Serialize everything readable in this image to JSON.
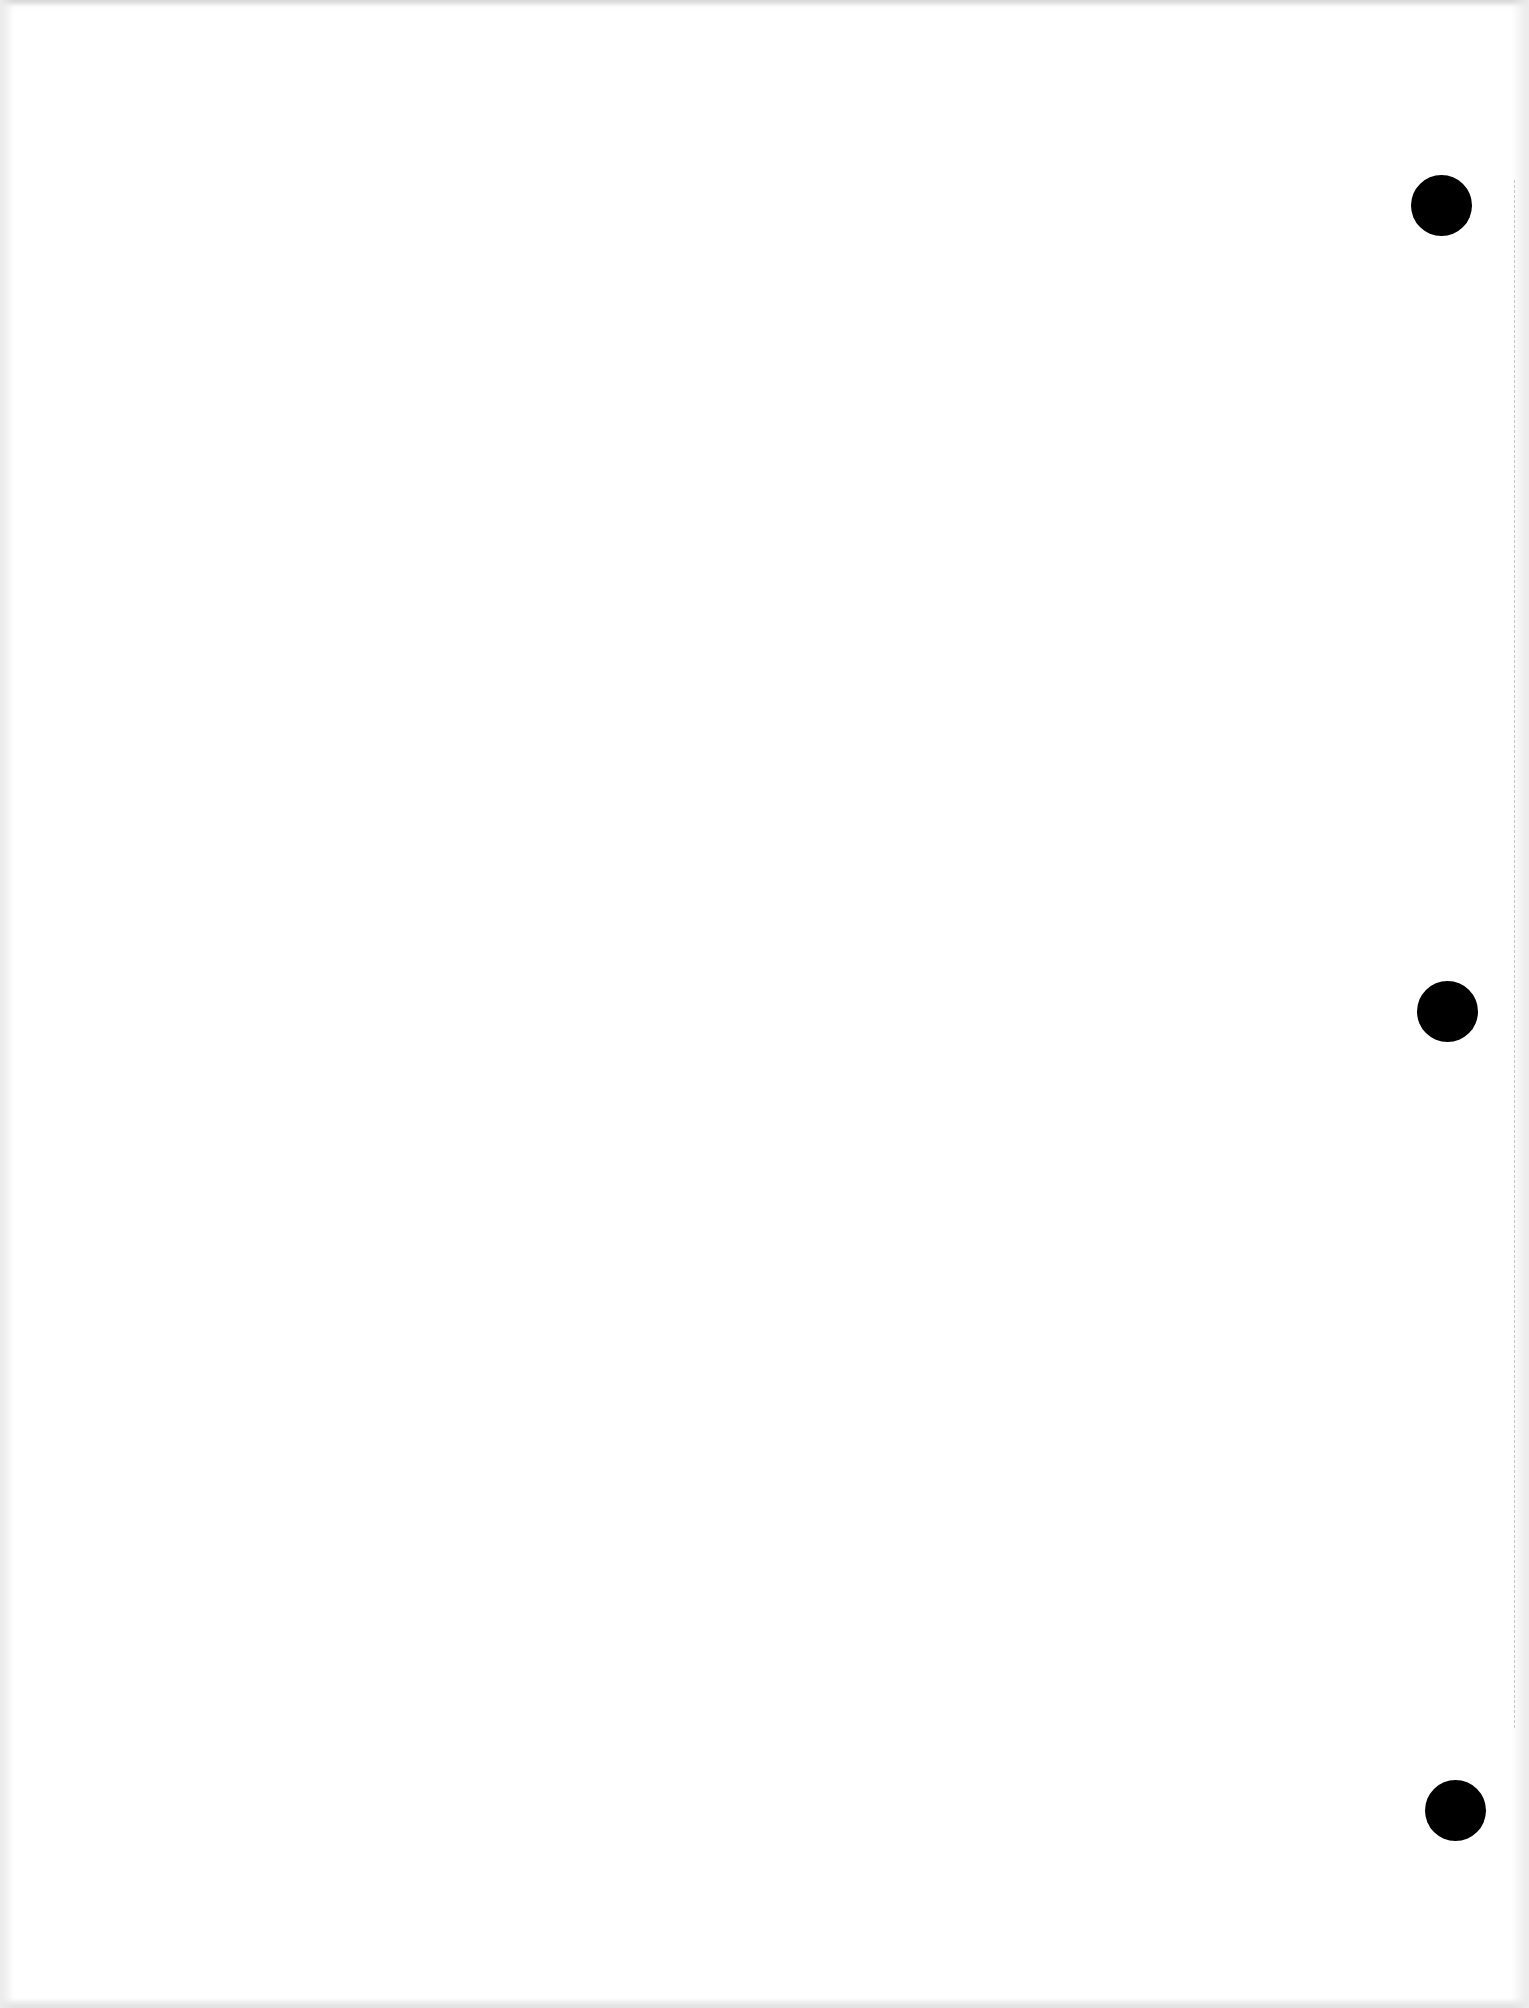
{
  "page": {
    "type": "blank loose-leaf paper scan",
    "background_color": "#ffffff",
    "text_content": "",
    "punch_holes": [
      {
        "position": "top",
        "center_x": 1441,
        "center_y": 205,
        "diameter": 61,
        "color": "#000000"
      },
      {
        "position": "middle",
        "center_x": 1447,
        "center_y": 1011,
        "diameter": 61,
        "color": "#000000"
      },
      {
        "position": "bottom",
        "center_x": 1455,
        "center_y": 1810,
        "diameter": 61,
        "color": "#000000"
      }
    ],
    "perforation_edge": {
      "side": "right",
      "x": 1514,
      "style": "dashed",
      "color": "#c6c6c6"
    }
  }
}
